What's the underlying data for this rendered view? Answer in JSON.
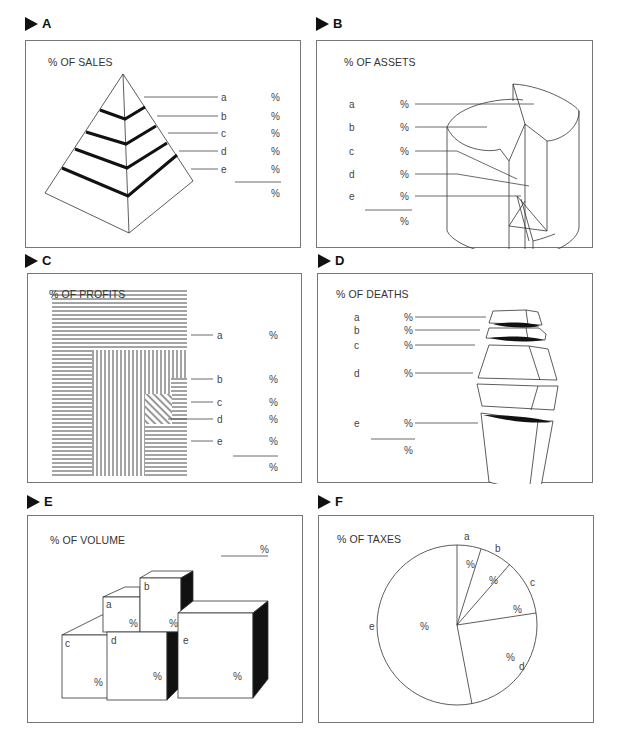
{
  "panels": {
    "A": {
      "label": "A",
      "title": "% OF SALES",
      "shape": "pyramid",
      "segments": [
        "a",
        "b",
        "c",
        "d",
        "e"
      ],
      "value_symbol": "%",
      "total_symbol": "%"
    },
    "B": {
      "label": "B",
      "title": "% OF ASSETS",
      "shape": "cylinder",
      "segments": [
        "a",
        "b",
        "c",
        "d",
        "e"
      ],
      "value_symbol": "%",
      "total_symbol": "%"
    },
    "C": {
      "label": "C",
      "title": "% OF PROFITS",
      "shape": "hatched-squares",
      "segments": [
        "a",
        "b",
        "c",
        "d",
        "e"
      ],
      "value_symbol": "%",
      "total_symbol": "%"
    },
    "D": {
      "label": "D",
      "title": "% OF DEATHS",
      "shape": "stacked-urn",
      "segments": [
        "a",
        "b",
        "c",
        "d",
        "e"
      ],
      "value_symbol": "%",
      "total_symbol": "%"
    },
    "E": {
      "label": "E",
      "title": "% OF VOLUME",
      "shape": "cubes",
      "segments": [
        "a",
        "b",
        "c",
        "d",
        "e"
      ],
      "value_symbol": "%",
      "total_symbol": "%"
    },
    "F": {
      "label": "F",
      "title": "% OF TAXES",
      "shape": "pie",
      "segments": [
        "a",
        "b",
        "c",
        "d",
        "e"
      ],
      "value_symbol": "%"
    }
  },
  "colors": {
    "ink": "#111111",
    "line": "#444444",
    "border": "#777777",
    "text": "#333333"
  }
}
